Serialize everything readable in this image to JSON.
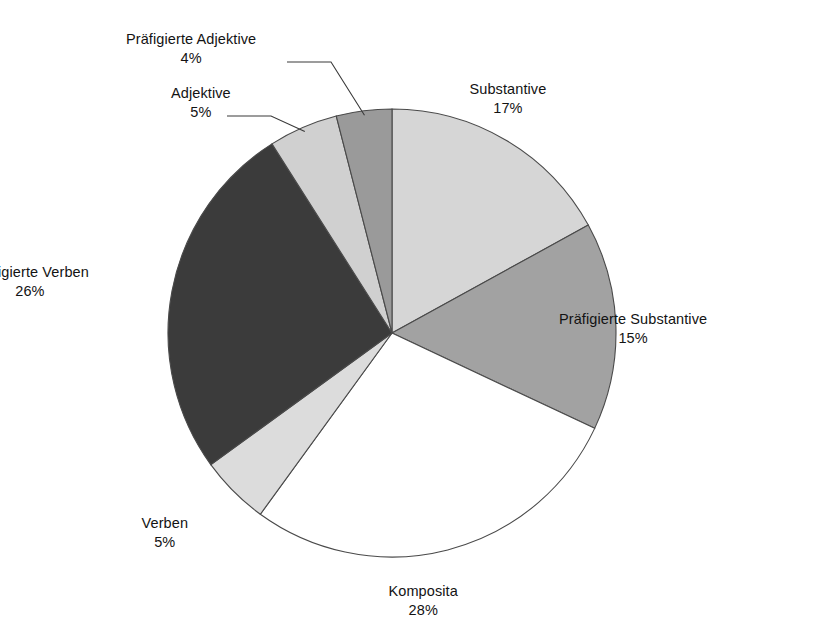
{
  "chart_data": {
    "type": "pie",
    "title": "",
    "subtitle": "",
    "xlabel": "",
    "ylabel": "",
    "legend_position": "none",
    "grid": false,
    "value_unit": "%",
    "start_angle_deg": 0,
    "direction": "clockwise",
    "categories": [
      "Substantive",
      "Präfigierte Substantive",
      "Komposita",
      "Verben",
      "Präfigierte Verben",
      "Adjektive",
      "Präfigierte Adjektive"
    ],
    "values": [
      17,
      15,
      28,
      5,
      26,
      5,
      4
    ],
    "colors": [
      "#d6d6d6",
      "#a2a2a2",
      "#ffffff",
      "#dcdcdc",
      "#3b3b3b",
      "#d0d0d0",
      "#9a9a9a"
    ],
    "slices": [
      {
        "label": "Substantive",
        "value": 17,
        "value_text": "17%",
        "color": "#d6d6d6",
        "start_deg": 0,
        "end_deg": 61.2,
        "label_x": 508,
        "label_y": 80,
        "leader": false
      },
      {
        "label": "Präfigierte Substantive",
        "value": 15,
        "value_text": "15%",
        "color": "#a2a2a2",
        "start_deg": 61.2,
        "end_deg": 115.2,
        "label_x": 633,
        "label_y": 310,
        "leader": false
      },
      {
        "label": "Komposita",
        "value": 28,
        "value_text": "28%",
        "color": "#ffffff",
        "start_deg": 115.2,
        "end_deg": 216.0,
        "label_x": 423,
        "label_y": 582,
        "leader": false
      },
      {
        "label": "Verben",
        "value": 5,
        "value_text": "5%",
        "color": "#dcdcdc",
        "start_deg": 216.0,
        "end_deg": 234.0,
        "label_x": 165,
        "label_y": 514,
        "leader": false
      },
      {
        "label": "Präfigierte Verben",
        "value": 26,
        "value_text": "26%",
        "color": "#3b3b3b",
        "start_deg": 234.0,
        "end_deg": 327.6,
        "label_x": 30,
        "label_y": 263,
        "leader": false
      },
      {
        "label": "Adjektive",
        "value": 5,
        "value_text": "5%",
        "color": "#d0d0d0",
        "start_deg": 327.6,
        "end_deg": 345.6,
        "label_x": 201,
        "label_y": 84,
        "leader": true
      },
      {
        "label": "Präfigierte Adjektive",
        "value": 4,
        "value_text": "4%",
        "color": "#9a9a9a",
        "start_deg": 345.6,
        "end_deg": 360.0,
        "label_x": 191,
        "label_y": 30,
        "leader": true
      }
    ],
    "geometry": {
      "center_x": 392,
      "center_y": 333,
      "radius": 224
    }
  }
}
